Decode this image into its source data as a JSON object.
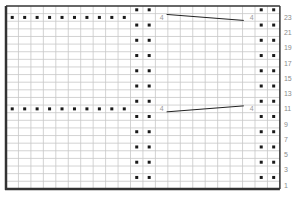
{
  "chart_data": {
    "type": "table",
    "title": "",
    "grid": {
      "columns": 22,
      "rows": 24,
      "left": 6,
      "top": 6,
      "cell_w": 12.45,
      "cell_h": 7.62
    },
    "row_labels": [
      "1",
      "3",
      "5",
      "7",
      "9",
      "11",
      "13",
      "15",
      "17",
      "19",
      "21",
      "23"
    ],
    "row_label_rows": [
      1,
      3,
      5,
      7,
      9,
      11,
      13,
      15,
      17,
      19,
      21,
      23
    ],
    "dots": {
      "band_columns": [
        10,
        11,
        20,
        21
      ],
      "band_rows": [
        2,
        4,
        6,
        8,
        10,
        12,
        14,
        16,
        18,
        20,
        22,
        24
      ],
      "side_columns": [
        0,
        1,
        2,
        3,
        4,
        5,
        6,
        7,
        8,
        9
      ],
      "side_rows": [
        23,
        11
      ]
    },
    "markers": [
      {
        "row": 23,
        "from_col": 12,
        "to_col": 19,
        "label_left": "4",
        "label_right": "4",
        "slope": "down"
      },
      {
        "row": 11,
        "from_col": 12,
        "to_col": 19,
        "label_left": "4",
        "label_right": "4",
        "slope": "up"
      }
    ],
    "colors": {
      "grid_line": "#c8c8c8",
      "border": "#333333",
      "dot": "#1a1a1a",
      "label": "#8a8a8a"
    }
  }
}
